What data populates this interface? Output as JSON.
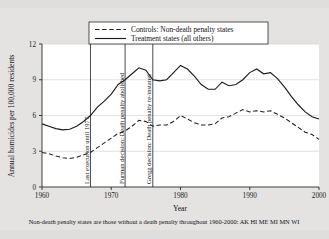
{
  "top_caption": "",
  "chart_data": {
    "type": "line",
    "title": "",
    "xlabel": "Year",
    "ylabel": "Annual homicides per 100,000 residents",
    "xlim": [
      1960,
      2000
    ],
    "ylim": [
      0,
      12
    ],
    "xticks": [
      1960,
      1970,
      1980,
      1990,
      2000
    ],
    "yticks": [
      0,
      3,
      6,
      9,
      12
    ],
    "grid": true,
    "legend_position": "top-center",
    "footnote": "Non-death penalty states are those without a death penalty throughout 1960-2000: AK HI ME MI MN WI",
    "x": [
      1960,
      1961,
      1962,
      1963,
      1964,
      1965,
      1966,
      1967,
      1968,
      1969,
      1970,
      1971,
      1972,
      1973,
      1974,
      1975,
      1976,
      1977,
      1978,
      1979,
      1980,
      1981,
      1982,
      1983,
      1984,
      1985,
      1986,
      1987,
      1988,
      1989,
      1990,
      1991,
      1992,
      1993,
      1994,
      1995,
      1996,
      1997,
      1998,
      1999,
      2000
    ],
    "series": [
      {
        "name": "Controls: Non-death penalty states",
        "style": "dashed",
        "values": [
          2.9,
          2.8,
          2.6,
          2.45,
          2.4,
          2.5,
          2.7,
          2.9,
          3.3,
          3.7,
          4.1,
          4.5,
          4.7,
          5.1,
          5.6,
          5.5,
          5.1,
          5.2,
          5.2,
          5.5,
          6.0,
          5.7,
          5.4,
          5.2,
          5.2,
          5.3,
          5.8,
          5.9,
          6.2,
          6.5,
          6.3,
          6.4,
          6.3,
          6.4,
          6.1,
          5.8,
          5.4,
          5.0,
          4.6,
          4.4,
          4.0
        ]
      },
      {
        "name": "Treatment states (all others)",
        "style": "solid",
        "values": [
          5.3,
          5.1,
          4.9,
          4.8,
          4.85,
          5.1,
          5.5,
          6.0,
          6.7,
          7.2,
          7.8,
          8.6,
          9.0,
          9.5,
          10.0,
          9.8,
          9.0,
          8.9,
          9.0,
          9.6,
          10.2,
          9.9,
          9.3,
          8.6,
          8.2,
          8.2,
          8.8,
          8.5,
          8.6,
          9.0,
          9.6,
          9.9,
          9.5,
          9.6,
          9.1,
          8.4,
          7.6,
          6.9,
          6.3,
          5.9,
          5.7
        ]
      }
    ],
    "events": [
      {
        "year": 1967,
        "label": "Last execution until 1977"
      },
      {
        "year": 1972,
        "label": "Furman decision: Death penalty abolished"
      },
      {
        "year": 1976,
        "label": "Gregg decision: Death penalty re-instated"
      }
    ]
  }
}
